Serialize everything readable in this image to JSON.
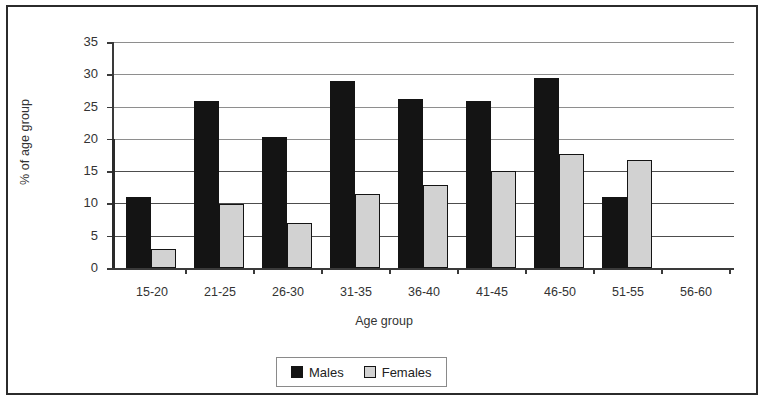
{
  "chart_data": {
    "type": "bar",
    "title": "",
    "xlabel": "Age group",
    "ylabel": "% of age group",
    "categories": [
      "15-20",
      "21-25",
      "26-30",
      "31-35",
      "36-40",
      "41-45",
      "46-50",
      "51-55",
      "56-60"
    ],
    "series": [
      {
        "name": "Males",
        "color": "#141414",
        "values": [
          11.0,
          25.8,
          20.3,
          29.0,
          26.1,
          25.9,
          29.5,
          11.0,
          0
        ]
      },
      {
        "name": "Females",
        "color": "#d2d2d2",
        "values": [
          3.0,
          9.9,
          6.9,
          11.5,
          12.8,
          15.0,
          17.7,
          16.7,
          0
        ]
      }
    ],
    "ylim": [
      0,
      35
    ],
    "yticks": [
      0,
      5,
      10,
      15,
      20,
      25,
      30,
      35
    ],
    "ytick_labels": [
      "0",
      "5",
      "10",
      "15",
      "20",
      "25",
      "30",
      "35"
    ],
    "grid": true,
    "grid_axis": "y",
    "legend_position": "bottom-center",
    "legend_entries": [
      "Males",
      "Females"
    ]
  }
}
